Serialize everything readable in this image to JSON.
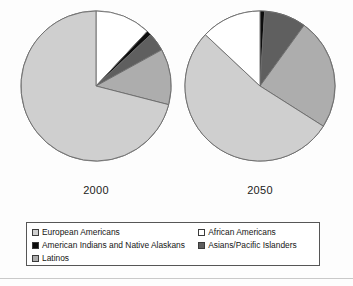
{
  "chart_data": {
    "type": "pie",
    "title": "",
    "legend_position": "bottom",
    "categories": [
      "European Americans",
      "African Americans",
      "American Indians and Native Alaskans",
      "Asians/Pacific Islanders",
      "Latinos"
    ],
    "colors": {
      "European Americans": "#cfcfcf",
      "African Americans": "#ffffff",
      "American Indians and Native Alaskans": "#0d0d0d",
      "Asians/Pacific Islanders": "#5f5f5f",
      "Latinos": "#adadad"
    },
    "charts": [
      {
        "label": "2000",
        "values": [
          71,
          12,
          1,
          4,
          12
        ],
        "slices": [
          {
            "name": "African Americans",
            "value": 12
          },
          {
            "name": "American Indians and Native Alaskans",
            "value": 1
          },
          {
            "name": "Asians/Pacific Islanders",
            "value": 4
          },
          {
            "name": "Latinos",
            "value": 12
          },
          {
            "name": "European Americans",
            "value": 71
          }
        ]
      },
      {
        "label": "2050",
        "values": [
          53,
          13,
          1,
          9,
          24
        ],
        "slices": [
          {
            "name": "American Indians and Native Alaskans",
            "value": 1
          },
          {
            "name": "Asians/Pacific Islanders",
            "value": 9
          },
          {
            "name": "Latinos",
            "value": 24
          },
          {
            "name": "European Americans",
            "value": 53
          },
          {
            "name": "African Americans",
            "value": 13
          }
        ]
      }
    ]
  },
  "years": {
    "first": "2000",
    "second": "2050"
  },
  "legend": {
    "rows": [
      {
        "left": {
          "label": "European Americans",
          "swatch": "european-swatch"
        },
        "right": {
          "label": "African Americans",
          "swatch": "african-swatch"
        }
      },
      {
        "left": {
          "label": "American Indians and Native Alaskans",
          "swatch": "indian-swatch"
        },
        "right": {
          "label": "Asians/Pacific Islanders",
          "swatch": "asian-swatch"
        }
      },
      {
        "left": {
          "label": "Latinos",
          "swatch": "latino-swatch"
        },
        "right": {
          "label": "",
          "swatch": ""
        }
      }
    ]
  }
}
